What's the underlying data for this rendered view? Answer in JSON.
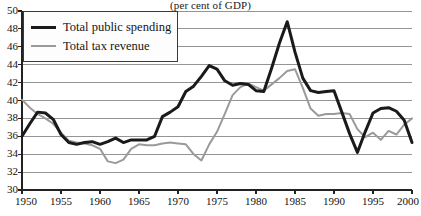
{
  "chart_data": {
    "type": "line",
    "title": "(per cent of GDP)",
    "xlabel": "",
    "ylabel": "",
    "xlim": [
      1950,
      2000
    ],
    "ylim": [
      30,
      50
    ],
    "grid": true,
    "legend_position": "top-left",
    "yticks": [
      30,
      32,
      34,
      36,
      38,
      40,
      42,
      44,
      46,
      48,
      50
    ],
    "xticks": [
      1950,
      1955,
      1960,
      1965,
      1970,
      1975,
      1980,
      1985,
      1990,
      1995,
      2000
    ],
    "x": [
      1950,
      1951,
      1952,
      1953,
      1954,
      1955,
      1956,
      1957,
      1958,
      1959,
      1960,
      1961,
      1962,
      1963,
      1964,
      1965,
      1966,
      1967,
      1968,
      1969,
      1970,
      1971,
      1972,
      1973,
      1974,
      1975,
      1976,
      1977,
      1978,
      1979,
      1980,
      1981,
      1982,
      1983,
      1984,
      1985,
      1986,
      1987,
      1988,
      1989,
      1990,
      1991,
      1992,
      1993,
      1994,
      1995,
      1996,
      1997,
      1998,
      1999,
      2000
    ],
    "series": [
      {
        "name": "Total public spending",
        "color": "#1a1a1a",
        "width": 3,
        "values": [
          36.0,
          37.4,
          38.7,
          38.6,
          37.9,
          36.2,
          35.3,
          35.1,
          35.3,
          35.4,
          35.1,
          35.4,
          35.8,
          35.3,
          35.6,
          35.6,
          35.6,
          36.0,
          38.2,
          38.7,
          39.3,
          41.0,
          41.6,
          42.7,
          43.9,
          43.5,
          42.2,
          41.7,
          41.9,
          41.8,
          41.1,
          41.0,
          43.6,
          46.4,
          48.8,
          45.4,
          42.5,
          41.1,
          40.9,
          41.0,
          41.1,
          38.7,
          36.3,
          34.2,
          36.5,
          38.6,
          39.1,
          39.2,
          38.8,
          37.8,
          35.3
        ]
      },
      {
        "name": "Total tax revenue",
        "color": "#9a9a9a",
        "width": 2,
        "values": [
          40.1,
          39.2,
          38.5,
          38.0,
          37.4,
          36.4,
          35.5,
          35.3,
          35.2,
          35.0,
          34.6,
          33.2,
          33.0,
          33.4,
          34.6,
          35.1,
          35.0,
          35.0,
          35.2,
          35.3,
          35.2,
          35.1,
          34.0,
          33.3,
          35.1,
          36.5,
          38.5,
          40.6,
          41.5,
          41.9,
          41.5,
          41.1,
          41.8,
          42.5,
          43.3,
          43.5,
          41.4,
          39.1,
          38.3,
          38.5,
          38.5,
          38.6,
          38.5,
          36.8,
          35.9,
          36.4,
          35.6,
          36.6,
          36.2,
          37.3,
          38.0
        ]
      }
    ]
  },
  "legend": {
    "items": [
      {
        "label": "Total public spending"
      },
      {
        "label": "Total tax revenue"
      }
    ]
  },
  "axis": {
    "y_labels": [
      "50",
      "48",
      "46",
      "44",
      "42",
      "40",
      "38",
      "36",
      "34",
      "32",
      "30"
    ],
    "x_labels": [
      "1950",
      "1955",
      "1960",
      "1965",
      "1970",
      "1975",
      "1980",
      "1985",
      "1990",
      "1995",
      "2000"
    ]
  },
  "colors": {
    "spending_line": "#1a1a1a",
    "revenue_line": "#9a9a9a",
    "grid": "#8a8a8a",
    "axis": "#222222",
    "background": "#ffffff"
  }
}
